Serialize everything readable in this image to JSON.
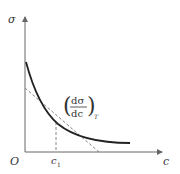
{
  "diagram": {
    "y_axis_label": "σ",
    "x_axis_label": "c",
    "origin_label": "O",
    "tick_label": "c",
    "tick_subscript": "1",
    "derivative_numerator": "dσ",
    "derivative_denominator": "dc",
    "derivative_subscript": "T",
    "colors": {
      "curve": "#222222",
      "axes": "#666666",
      "dashed": "#777777"
    }
  }
}
